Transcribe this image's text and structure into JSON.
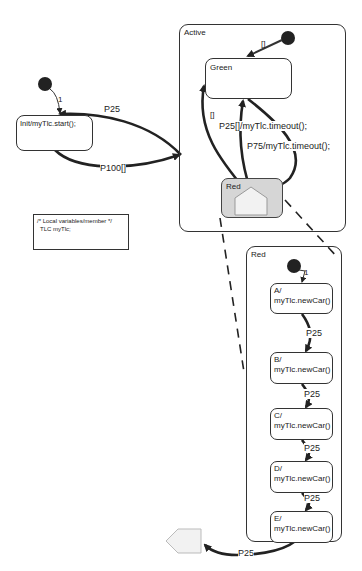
{
  "diagram": {
    "type": "state-machine",
    "colors": {
      "line": "#333333",
      "red_state_fill": "#d6d6d6",
      "pseudo_fill": "#f2f2f2"
    },
    "init_state": {
      "label": "Init/myTlc.start();"
    },
    "init_transition_label": "1",
    "note": {
      "line1": "/* Local variables/member */",
      "line2": "TLC myTlc;"
    },
    "active": {
      "label": "Active",
      "initial_guard": "[]",
      "green": {
        "label": "Green"
      },
      "red": {
        "label": "Red"
      },
      "transitions": {
        "red_to_green_guard": "[]",
        "p25": "P25[]/myTlc.timeout();",
        "p75": "P75/myTlc.timeout();"
      }
    },
    "outer_transitions": {
      "active_to_init": "P25",
      "init_to_active": "P100[]"
    },
    "red_detail": {
      "label": "Red",
      "initial_label": "1",
      "substates": [
        {
          "name": "A/",
          "action": "myTlc.newCar()"
        },
        {
          "name": "B/",
          "action": "myTlc.newCar()"
        },
        {
          "name": "C/",
          "action": "myTlc.newCar()"
        },
        {
          "name": "D/",
          "action": "myTlc.newCar()"
        },
        {
          "name": "E/",
          "action": "myTlc.newCar()"
        }
      ],
      "transition_labels": [
        "P25",
        "P25",
        "P25",
        "P25"
      ],
      "exit_label": "P25"
    }
  }
}
